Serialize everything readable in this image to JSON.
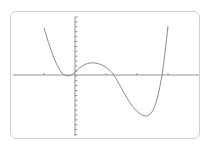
{
  "chart_data": {
    "type": "line",
    "title": "",
    "xlabel": "",
    "ylabel": "",
    "grid": false,
    "legend": null,
    "x_ticks": [
      -1,
      0,
      1,
      2,
      3
    ],
    "xlim": [
      -2,
      4
    ],
    "ylim": [
      -2,
      1.5
    ],
    "series": [
      {
        "name": "f(x)",
        "x": [
          -1.0,
          -0.5,
          -0.25,
          0.0,
          0.3,
          0.65,
          1.0,
          1.26,
          1.8,
          2.29,
          2.6,
          2.8,
          3.0
        ],
        "y": [
          1.5,
          0.25,
          -0.03,
          0.1,
          0.3,
          0.38,
          0.25,
          0.0,
          -0.8,
          -1.32,
          -0.8,
          0.0,
          1.57
        ]
      }
    ],
    "colors": {
      "curve": "#8a8a8a",
      "axis": "#7a7a7a",
      "frame": "#cfcfcf"
    }
  }
}
